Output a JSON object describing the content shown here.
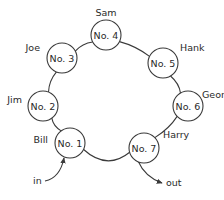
{
  "diagram": {
    "nodes": [
      {
        "id": "n1",
        "label": "No. 1",
        "name": "Bill"
      },
      {
        "id": "n2",
        "label": "No. 2",
        "name": "Jim"
      },
      {
        "id": "n3",
        "label": "No. 3",
        "name": "Joe"
      },
      {
        "id": "n4",
        "label": "No. 4",
        "name": "Sam"
      },
      {
        "id": "n5",
        "label": "No. 5",
        "name": "Hank"
      },
      {
        "id": "n6",
        "label": "No. 6",
        "name": "George"
      },
      {
        "id": "n7",
        "label": "No. 7",
        "name": "Harry"
      }
    ],
    "edges": [
      [
        "n1",
        "n2"
      ],
      [
        "n2",
        "n3"
      ],
      [
        "n3",
        "n4"
      ],
      [
        "n4",
        "n5"
      ],
      [
        "n5",
        "n6"
      ],
      [
        "n6",
        "n7"
      ],
      [
        "n7",
        "n1"
      ]
    ],
    "entry": {
      "label": "in",
      "target": "n1"
    },
    "exit": {
      "label": "out",
      "source": "n7"
    }
  }
}
